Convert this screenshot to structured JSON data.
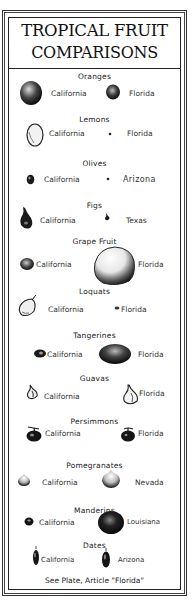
{
  "title": {
    "line1": "TROPICAL FRUIT",
    "line2": "COMPARISONS"
  },
  "sections": [
    {
      "name": "Oranges",
      "left_label": "California",
      "right_label": "Florida"
    },
    {
      "name": "Lemons",
      "left_label": "California",
      "right_label": "Florida"
    },
    {
      "name": "Olives",
      "left_label": "California",
      "right_label": "Arizona"
    },
    {
      "name": "Figs",
      "left_label": "California",
      "right_label": "Texas"
    },
    {
      "name": "Grape Fruit",
      "left_label": "California",
      "right_label": "Florida"
    },
    {
      "name": "Loquats",
      "left_label": "California",
      "right_label": "Florida"
    },
    {
      "name": "Tangerines",
      "left_label": "California",
      "right_label": "Florida"
    },
    {
      "name": "Guavas",
      "left_label": "California",
      "right_label": "Florida"
    },
    {
      "name": "Persimmons",
      "left_label": "California",
      "right_label": "Florida"
    },
    {
      "name": "Pomegranates",
      "left_label": "California",
      "right_label": "Nevada"
    },
    {
      "name": "Manderins",
      "left_label": "California",
      "right_label": "Louisiana"
    },
    {
      "name": "Dates",
      "left_label": "California",
      "right_label": "Arizona"
    }
  ],
  "footer": "See Plate, Article \"Florida\""
}
